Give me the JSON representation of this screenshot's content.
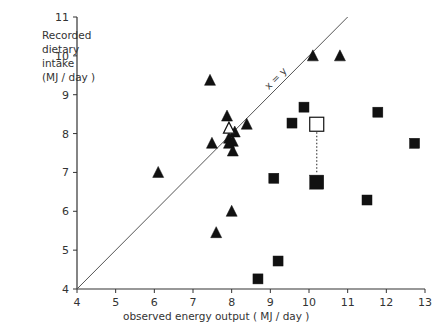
{
  "chart_data": {
    "type": "scatter",
    "title": "",
    "xlabel": "observed energy output   ( MJ / day )",
    "ylabel": "Recorded\ndietary\nintake\n(MJ / day )",
    "xlim": [
      4,
      13
    ],
    "ylim": [
      4,
      11
    ],
    "xticks": [
      4,
      5,
      6,
      7,
      8,
      9,
      10,
      11,
      12,
      13
    ],
    "yticks": [
      4,
      5,
      6,
      7,
      8,
      9,
      10,
      11
    ],
    "grid": false,
    "reference_line": {
      "label": "x = y",
      "from": [
        4,
        4
      ],
      "to": [
        11,
        11
      ]
    },
    "series": [
      {
        "name": "triangles (filled)",
        "marker": "triangle-filled",
        "points": [
          {
            "x": 6.1,
            "y": 7.0
          },
          {
            "x": 7.44,
            "y": 9.37
          },
          {
            "x": 7.88,
            "y": 8.45
          },
          {
            "x": 8.08,
            "y": 8.04
          },
          {
            "x": 8.39,
            "y": 8.24
          },
          {
            "x": 7.49,
            "y": 7.75
          },
          {
            "x": 7.93,
            "y": 7.88
          },
          {
            "x": 8.03,
            "y": 7.8
          },
          {
            "x": 7.93,
            "y": 7.75
          },
          {
            "x": 8.03,
            "y": 7.55
          },
          {
            "x": 8.0,
            "y": 6.0
          },
          {
            "x": 7.6,
            "y": 5.45
          },
          {
            "x": 10.1,
            "y": 10.0
          },
          {
            "x": 10.8,
            "y": 10.0
          }
        ]
      },
      {
        "name": "triangle mean (open)",
        "marker": "triangle-open",
        "points": [
          {
            "x": 7.93,
            "y": 8.14
          }
        ]
      },
      {
        "name": "squares (filled)",
        "marker": "square-filled",
        "points": [
          {
            "x": 9.87,
            "y": 8.68
          },
          {
            "x": 9.56,
            "y": 8.27
          },
          {
            "x": 11.78,
            "y": 8.55
          },
          {
            "x": 12.73,
            "y": 7.75
          },
          {
            "x": 9.09,
            "y": 6.85
          },
          {
            "x": 11.5,
            "y": 6.29
          },
          {
            "x": 9.2,
            "y": 4.72
          },
          {
            "x": 8.68,
            "y": 4.26
          }
        ]
      },
      {
        "name": "square mean (filled, large)",
        "marker": "square-filled-large",
        "points": [
          {
            "x": 10.2,
            "y": 6.75
          }
        ]
      },
      {
        "name": "square mean (open, large)",
        "marker": "square-open-large",
        "points": [
          {
            "x": 10.2,
            "y": 8.24
          }
        ]
      }
    ],
    "annotations": [
      {
        "type": "dotted-line",
        "from": [
          10.2,
          8.24
        ],
        "to": [
          10.2,
          6.75
        ]
      }
    ]
  },
  "labels": {
    "ylabel": "Recorded\ndietary\nintake\n(MJ / day )",
    "xlabel": "observed energy output   ( MJ / day )",
    "diag": "x = y"
  }
}
